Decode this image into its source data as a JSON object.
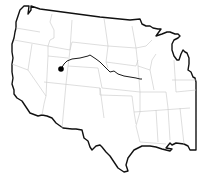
{
  "map": {
    "region": "Contiguous United States",
    "colors": {
      "outline": "#111111",
      "state_borders": "#c8c8c8",
      "route": "#1a1a1a",
      "marker": "#000000",
      "background": "#ffffff"
    },
    "marker": {
      "x": 61,
      "y": 69,
      "radius": 2.8
    },
    "route": {
      "start": {
        "x": 61,
        "y": 69
      },
      "end": {
        "x": 142,
        "y": 79
      }
    }
  }
}
